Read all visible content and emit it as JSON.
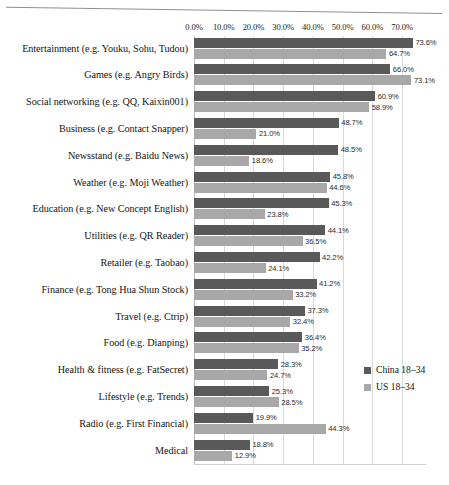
{
  "chart_data": {
    "type": "bar",
    "orientation": "horizontal",
    "title": "",
    "subtitle": "",
    "xlabel": "",
    "ylabel": "",
    "xlim": [
      0,
      78
    ],
    "axis_max_label": 70,
    "grid": true,
    "legend_position": "right",
    "value_suffix": "%",
    "categories": [
      "Entertainment (e.g. Youku, Sohu, Tudou)",
      "Games (e.g. Angry Birds)",
      "Social networking (e.g. QQ, Kaixin001)",
      "Business (e.g. Contact Snapper)",
      "Newsstand (e.g. Baidu News)",
      "Weather (e.g. Moji Weather)",
      "Education (e.g. New Concept English)",
      "Utilities (e.g. QR Reader)",
      "Retailer (e.g. Taobao)",
      "Finance (e.g. Tong Hua Shun Stock)",
      "Travel (e.g. Ctrip)",
      "Food (e.g. Dianping)",
      "Health & fitness (e.g. FatSecret)",
      "Lifestyle (e.g. Trends)",
      "Radio (e.g. First Financial)",
      "Medical"
    ],
    "tick_labels": [
      "0.0%",
      "10.0%",
      "20.0%",
      "30.0%",
      "40.0%",
      "50.0%",
      "60.0%",
      "70.0%"
    ],
    "tick_values": [
      0,
      10,
      20,
      30,
      40,
      50,
      60,
      70
    ],
    "series": [
      {
        "name": "China 18–34",
        "color": "#595959",
        "values": [
          73.6,
          66.0,
          60.9,
          48.7,
          48.5,
          45.8,
          45.3,
          44.1,
          42.2,
          41.2,
          37.3,
          36.4,
          28.3,
          25.3,
          19.9,
          18.8
        ],
        "labels": [
          "73.6%",
          "66.0%",
          "60.9%",
          "48.7%",
          "48.5%",
          "45.8%",
          "45.3%",
          "44.1%",
          "42.2%",
          "41.2%",
          "37.3%",
          "36.4%",
          "28.3%",
          "25.3%",
          "19.9%",
          "18.8%"
        ]
      },
      {
        "name": "US 18–34",
        "color": "#a8a8a8",
        "values": [
          64.7,
          73.1,
          58.9,
          21.0,
          18.6,
          44.6,
          23.8,
          36.5,
          24.1,
          33.2,
          32.4,
          35.2,
          24.7,
          28.5,
          44.3,
          12.9
        ],
        "labels": [
          "64.7%",
          "73.1%",
          "58.9%",
          "21.0%",
          "18.6%",
          "44.6%",
          "23.8%",
          "36.5%",
          "24.1%",
          "33.2%",
          "32.4%",
          "35.2%",
          "24.7%",
          "28.5%",
          "44.3%",
          "12.9%"
        ]
      }
    ]
  },
  "legend": {
    "items": [
      {
        "label": "China 18–34",
        "color": "#595959"
      },
      {
        "label": "US 18–34",
        "color": "#a8a8a8"
      }
    ]
  }
}
